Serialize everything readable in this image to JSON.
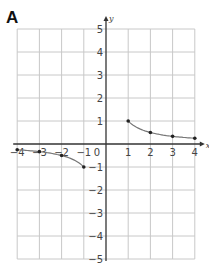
{
  "panel_label": "A",
  "chart_data": {
    "type": "line",
    "title": "",
    "xlabel": "x",
    "ylabel": "y",
    "xlim": [
      -4,
      4
    ],
    "ylim": [
      -5,
      5
    ],
    "grid": true,
    "x_ticks": [
      -4,
      -3,
      -2,
      -1,
      0,
      1,
      2,
      3,
      4
    ],
    "y_ticks": [
      -5,
      -4,
      -3,
      -2,
      -1,
      1,
      2,
      3,
      4,
      5
    ],
    "series": [
      {
        "name": "left branch",
        "x": [
          -4,
          -3,
          -2,
          -1
        ],
        "y": [
          -0.25,
          -0.333,
          -0.5,
          -1
        ]
      },
      {
        "name": "right branch",
        "x": [
          1,
          2,
          3,
          4
        ],
        "y": [
          1,
          0.5,
          0.333,
          0.25
        ]
      }
    ],
    "function": "y = 1/x"
  }
}
